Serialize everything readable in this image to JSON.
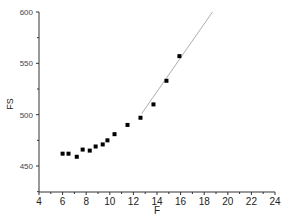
{
  "chart_data": {
    "type": "scatter",
    "title": "",
    "xlabel": "F",
    "ylabel": "FS",
    "xlim": [
      4,
      24
    ],
    "ylim": [
      425,
      600
    ],
    "x_ticks": [
      4,
      6,
      8,
      10,
      12,
      14,
      16,
      18,
      20,
      22,
      24
    ],
    "y_ticks": [
      450,
      500,
      550,
      600
    ],
    "grid": false,
    "legend": null,
    "series": [
      {
        "name": "data",
        "kind": "scatter",
        "marker": "square",
        "color": "#000000",
        "x": [
          6.0,
          6.5,
          7.2,
          7.7,
          8.3,
          8.8,
          9.4,
          9.8,
          10.4,
          11.5,
          12.6,
          13.7,
          14.8,
          15.9
        ],
        "y": [
          462,
          462,
          459,
          466,
          465,
          469,
          471,
          475,
          481,
          490,
          497,
          510,
          533,
          557
        ]
      },
      {
        "name": "linear fit",
        "kind": "line",
        "color": "#999999",
        "x": [
          12.7,
          18.7
        ],
        "y": [
          501,
          600
        ]
      }
    ]
  },
  "labels": {
    "xlabel": "F",
    "ylabel": "FS"
  }
}
